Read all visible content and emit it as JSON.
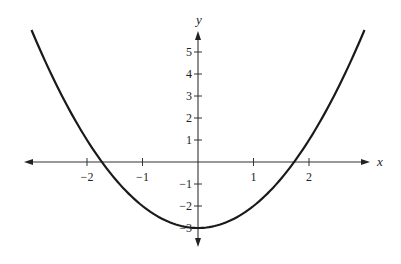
{
  "chart_data": {
    "type": "line",
    "title": "",
    "function": "y = x^2 - 3",
    "xlabel": "x",
    "ylabel": "y",
    "xlim": [
      -3.1,
      3.1
    ],
    "ylim": [
      -3.5,
      6
    ],
    "grid": false,
    "legend": null,
    "x_ticks": [
      -2,
      -1,
      1,
      2
    ],
    "x_tick_labels": [
      "−2",
      "−1",
      "1",
      "2"
    ],
    "y_ticks": [
      -3,
      -2,
      -1,
      1,
      2,
      3,
      4,
      5
    ],
    "y_tick_labels": [
      "−3",
      "−2",
      "−1",
      "1",
      "2",
      "3",
      "4",
      "5"
    ],
    "series": [
      {
        "name": "parabola",
        "x": [
          -3,
          -2.5,
          -2,
          -1.732,
          -1.5,
          -1,
          -0.5,
          0,
          0.5,
          1,
          1.5,
          1.732,
          2,
          2.5,
          3
        ],
        "y": [
          6,
          3.25,
          1,
          0,
          -0.75,
          -2,
          -2.75,
          -3,
          -2.75,
          -2,
          -0.75,
          0,
          1,
          3.25,
          6
        ]
      }
    ],
    "annotations": []
  }
}
